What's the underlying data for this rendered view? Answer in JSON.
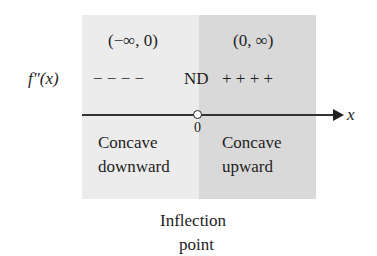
{
  "intervals": {
    "left": "(−∞, 0)",
    "right": "(0, ∞)"
  },
  "sign_row": {
    "label": "f″(x)",
    "left_signs": "− − − −",
    "critical": "ND",
    "right_signs": "+ + + +"
  },
  "axis": {
    "variable": "x",
    "point_label": "0"
  },
  "regions": {
    "left_line1": "Concave",
    "left_line2": "downward",
    "right_line1": "Concave",
    "right_line2": "upward"
  },
  "caption": {
    "line1": "Inflection",
    "line2": "point"
  },
  "colors": {
    "left_panel": "#ececec",
    "right_panel": "#d9d9d9"
  }
}
